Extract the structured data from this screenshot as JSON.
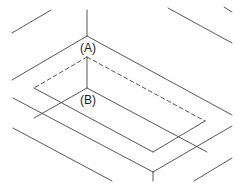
{
  "diagram": {
    "title": "",
    "labels": {
      "a": "(A)",
      "b": "(B)"
    },
    "stroke_color": "#444444",
    "background": "#ffffff"
  }
}
